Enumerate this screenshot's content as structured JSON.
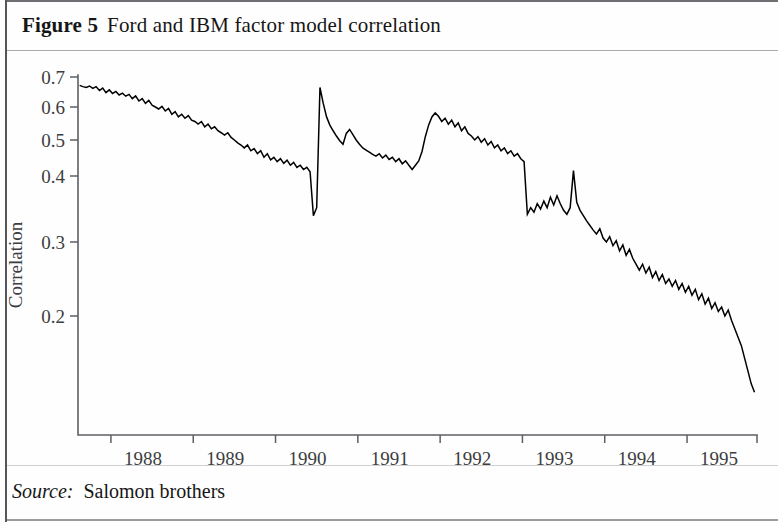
{
  "figure": {
    "number_label": "Figure 5",
    "title": "Ford and IBM factor model correlation",
    "source_label": "Source:",
    "source_value": "Salomon brothers"
  },
  "chart_data": {
    "type": "line",
    "title": "Ford and IBM factor model correlation",
    "xlabel": "",
    "ylabel": "Correlation",
    "grid": false,
    "legend": false,
    "xlim": [
      1987.6,
      1995.85
    ],
    "ylim": [
      0.1,
      0.715
    ],
    "x_tick_values": [
      1988,
      1989,
      1990,
      1991,
      1992,
      1993,
      1994,
      1995
    ],
    "x_tick_labels": [
      "1988",
      "1989",
      "1990",
      "1991",
      "1992",
      "1993",
      "1994",
      "1995"
    ],
    "y_tick_values": [
      0.2,
      0.3,
      0.4,
      0.5,
      0.6,
      0.7
    ],
    "y_tick_labels": [
      "0.2",
      "0.3",
      "0.4",
      "0.5",
      "0.6",
      "0.7"
    ],
    "series": [
      {
        "name": "Ford-IBM factor model correlation",
        "color": "#000000",
        "x": [
          1987.62,
          1987.66,
          1987.7,
          1987.74,
          1987.78,
          1987.82,
          1987.86,
          1987.9,
          1987.94,
          1987.98,
          1988.02,
          1988.06,
          1988.1,
          1988.14,
          1988.18,
          1988.22,
          1988.26,
          1988.3,
          1988.34,
          1988.38,
          1988.42,
          1988.46,
          1988.5,
          1988.54,
          1988.58,
          1988.62,
          1988.66,
          1988.7,
          1988.74,
          1988.78,
          1988.82,
          1988.86,
          1988.9,
          1988.94,
          1988.98,
          1989.02,
          1989.06,
          1989.1,
          1989.14,
          1989.18,
          1989.22,
          1989.26,
          1989.3,
          1989.34,
          1989.38,
          1989.42,
          1989.46,
          1989.5,
          1989.54,
          1989.58,
          1989.62,
          1989.66,
          1989.7,
          1989.74,
          1989.78,
          1989.82,
          1989.86,
          1989.9,
          1989.94,
          1989.98,
          1990.02,
          1990.06,
          1990.1,
          1990.14,
          1990.18,
          1990.22,
          1990.26,
          1990.3,
          1990.34,
          1990.38,
          1990.42,
          1990.46,
          1990.5,
          1990.54,
          1990.58,
          1990.62,
          1990.66,
          1990.7,
          1990.74,
          1990.78,
          1990.82,
          1990.86,
          1990.9,
          1990.94,
          1990.98,
          1991.02,
          1991.06,
          1991.1,
          1991.14,
          1991.18,
          1991.22,
          1991.26,
          1991.3,
          1991.34,
          1991.38,
          1991.42,
          1991.46,
          1991.5,
          1991.54,
          1991.58,
          1991.62,
          1991.66,
          1991.7,
          1991.74,
          1991.78,
          1991.82,
          1991.86,
          1991.9,
          1991.94,
          1991.98,
          1992.02,
          1992.06,
          1992.1,
          1992.14,
          1992.18,
          1992.22,
          1992.26,
          1992.3,
          1992.34,
          1992.38,
          1992.42,
          1992.46,
          1992.5,
          1992.54,
          1992.58,
          1992.62,
          1992.66,
          1992.7,
          1992.74,
          1992.78,
          1992.82,
          1992.86,
          1992.9,
          1992.94,
          1992.98,
          1993.02,
          1993.06,
          1993.1,
          1993.14,
          1993.18,
          1993.22,
          1993.26,
          1993.3,
          1993.34,
          1993.38,
          1993.42,
          1993.46,
          1993.5,
          1993.54,
          1993.58,
          1993.62,
          1993.66,
          1993.7,
          1993.74,
          1993.78,
          1993.82,
          1993.86,
          1993.9,
          1993.94,
          1993.98,
          1994.02,
          1994.06,
          1994.1,
          1994.14,
          1994.18,
          1994.22,
          1994.26,
          1994.3,
          1994.34,
          1994.38,
          1994.42,
          1994.46,
          1994.5,
          1994.54,
          1994.58,
          1994.62,
          1994.66,
          1994.7,
          1994.74,
          1994.78,
          1994.82,
          1994.86,
          1994.9,
          1994.94,
          1994.98,
          1995.02,
          1995.06,
          1995.1,
          1995.14,
          1995.18,
          1995.22,
          1995.26,
          1995.3,
          1995.34,
          1995.38,
          1995.42,
          1995.46,
          1995.5,
          1995.54,
          1995.58,
          1995.62,
          1995.66,
          1995.7,
          1995.74,
          1995.78,
          1995.82
        ],
        "y": [
          0.672,
          0.668,
          0.665,
          0.67,
          0.662,
          0.668,
          0.655,
          0.663,
          0.648,
          0.657,
          0.645,
          0.652,
          0.64,
          0.646,
          0.636,
          0.642,
          0.628,
          0.637,
          0.62,
          0.628,
          0.612,
          0.622,
          0.606,
          0.6,
          0.594,
          0.602,
          0.588,
          0.596,
          0.578,
          0.586,
          0.57,
          0.578,
          0.566,
          0.574,
          0.56,
          0.556,
          0.548,
          0.556,
          0.54,
          0.548,
          0.534,
          0.54,
          0.528,
          0.522,
          0.515,
          0.522,
          0.508,
          0.5,
          0.492,
          0.486,
          0.478,
          0.486,
          0.47,
          0.476,
          0.462,
          0.47,
          0.452,
          0.462,
          0.445,
          0.452,
          0.44,
          0.448,
          0.435,
          0.444,
          0.43,
          0.438,
          0.424,
          0.43,
          0.418,
          0.424,
          0.412,
          0.34,
          0.352,
          0.665,
          0.612,
          0.57,
          0.545,
          0.528,
          0.512,
          0.498,
          0.488,
          0.52,
          0.532,
          0.516,
          0.5,
          0.488,
          0.478,
          0.472,
          0.466,
          0.46,
          0.455,
          0.462,
          0.45,
          0.458,
          0.446,
          0.452,
          0.44,
          0.448,
          0.434,
          0.442,
          0.43,
          0.418,
          0.43,
          0.442,
          0.468,
          0.51,
          0.545,
          0.57,
          0.582,
          0.572,
          0.556,
          0.566,
          0.548,
          0.56,
          0.54,
          0.552,
          0.528,
          0.54,
          0.52,
          0.512,
          0.5,
          0.51,
          0.494,
          0.504,
          0.486,
          0.496,
          0.478,
          0.486,
          0.47,
          0.478,
          0.462,
          0.47,
          0.455,
          0.462,
          0.448,
          0.44,
          0.342,
          0.352,
          0.345,
          0.358,
          0.35,
          0.362,
          0.352,
          0.368,
          0.356,
          0.37,
          0.358,
          0.348,
          0.342,
          0.352,
          0.415,
          0.36,
          0.348,
          0.34,
          0.332,
          0.325,
          0.318,
          0.312,
          0.32,
          0.306,
          0.3,
          0.308,
          0.295,
          0.302,
          0.288,
          0.296,
          0.282,
          0.29,
          0.278,
          0.27,
          0.262,
          0.27,
          0.258,
          0.266,
          0.252,
          0.26,
          0.248,
          0.256,
          0.244,
          0.25,
          0.24,
          0.248,
          0.236,
          0.244,
          0.232,
          0.24,
          0.228,
          0.236,
          0.222,
          0.23,
          0.216,
          0.224,
          0.21,
          0.218,
          0.206,
          0.212,
          0.2,
          0.208,
          0.196,
          0.188,
          0.18,
          0.172,
          0.16,
          0.148,
          0.136,
          0.128
        ]
      }
    ],
    "annotations": [
      {
        "text": "series minimum",
        "approx_x": 1992.48,
        "approx_y": 0.115
      },
      {
        "text": "series maximum",
        "approx_x": 1987.74,
        "approx_y": 0.672
      }
    ]
  }
}
